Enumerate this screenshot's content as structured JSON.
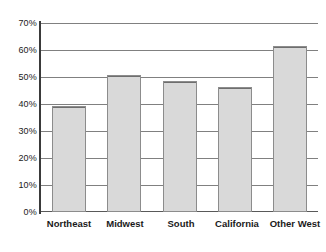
{
  "chart_data": {
    "type": "bar",
    "title": "",
    "subtitle": "",
    "xlabel": "",
    "ylabel": "",
    "categories": [
      "Northeast",
      "Midwest",
      "South",
      "California",
      "Other West"
    ],
    "values": [
      39.3,
      50.7,
      48.5,
      46.3,
      61.5
    ],
    "value_suffix": "%",
    "ylim": [
      0,
      70
    ],
    "ytick_values": [
      0,
      10,
      20,
      30,
      40,
      50,
      60,
      70
    ],
    "ytick_labels": [
      "0%",
      "10%",
      "20%",
      "30%",
      "40%",
      "50%",
      "60%",
      "70%"
    ],
    "grid": true,
    "grid_axis": "y",
    "legend": false,
    "legend_position": "none",
    "bar_fill_color": "#d9d9d9",
    "bar_border_color": "#8c8c8c",
    "gridline_color": "#808080",
    "axis_color": "#3a3a3a",
    "text_color": "#1a1a1a",
    "background_color": "#ffffff"
  }
}
